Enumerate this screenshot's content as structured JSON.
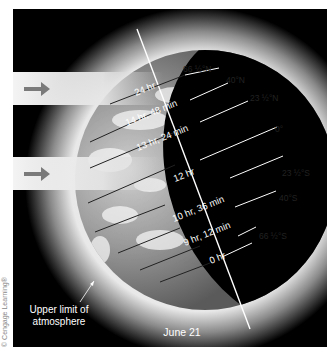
{
  "diagram": {
    "date_label": "June 21",
    "atmosphere_label_line1": "Upper limit of",
    "atmosphere_label_line2": "atmosphere",
    "credit": "© Cengage Learning®",
    "sunlight_arrows": [
      "sun-ray-arrow-1",
      "sun-ray-arrow-2"
    ],
    "latitudes": [
      {
        "name": "66 ½°N",
        "daylength": "24 hr"
      },
      {
        "name": "40°N",
        "daylength": "14 hr, 48 min"
      },
      {
        "name": "23 ½°N",
        "daylength": "13 hr, 24 min"
      },
      {
        "name": "0°",
        "daylength": "12 hr"
      },
      {
        "name": "23 ½°S",
        "daylength": "10 hr, 36 min"
      },
      {
        "name": "40°S",
        "daylength": "9 hr, 12 min"
      },
      {
        "name": "66 ½°S",
        "daylength": "0 hr"
      }
    ],
    "colors": {
      "background": "#000000",
      "frame": "#ffffff",
      "arrow": "#7a7a7a",
      "beam": "#f2f2f2",
      "label_light": "#ffffff",
      "label_dark": "#222222"
    }
  }
}
